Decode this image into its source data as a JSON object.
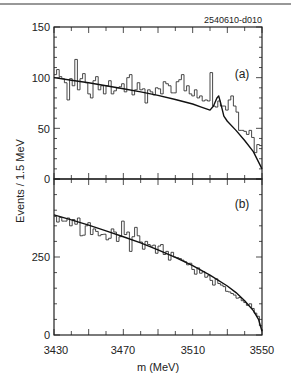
{
  "chart_data": [
    {
      "type": "bar",
      "panel": "(a)",
      "title": "",
      "id_label": "2540610-d010",
      "xlabel": "m (MeV)",
      "ylabel": "Events / 1.5 MeV",
      "xlim": [
        3430,
        3550
      ],
      "ylim": [
        0,
        150
      ],
      "yticks": [
        0,
        50,
        100,
        150
      ],
      "xticks": [
        3430,
        3470,
        3510,
        3550
      ],
      "bin_width": 1.5,
      "histogram": [
        103,
        108,
        101,
        99,
        95,
        78,
        99,
        92,
        118,
        88,
        99,
        104,
        95,
        84,
        80,
        97,
        101,
        88,
        92,
        84,
        92,
        97,
        84,
        87,
        90,
        91,
        94,
        86,
        100,
        103,
        83,
        88,
        95,
        88,
        89,
        75,
        88,
        86,
        83,
        90,
        89,
        84,
        96,
        94,
        92,
        85,
        85,
        96,
        98,
        103,
        87,
        92,
        84,
        82,
        88,
        80,
        82,
        77,
        78,
        77,
        105,
        72,
        71,
        77,
        72,
        72,
        68,
        78,
        82,
        72,
        66,
        48,
        48,
        47,
        44,
        48,
        41,
        26,
        34,
        33
      ],
      "fit": {
        "x": [
          3430,
          3440,
          3450,
          3460,
          3470,
          3480,
          3490,
          3500,
          3510,
          3515,
          3520,
          3522,
          3524,
          3525,
          3526,
          3528,
          3530,
          3535,
          3540,
          3545,
          3550
        ],
        "y": [
          100,
          97.5,
          95,
          92,
          89,
          86,
          82.5,
          78.5,
          74,
          71,
          68,
          72,
          80,
          82,
          76,
          62,
          57,
          48,
          38,
          27,
          10
        ]
      }
    },
    {
      "type": "bar",
      "panel": "(b)",
      "xlabel": "m (MeV)",
      "ylabel": "Events / 1.5 MeV",
      "xlim": [
        3430,
        3550
      ],
      "ylim": [
        0,
        500
      ],
      "yticks": [
        0,
        250
      ],
      "xticks": [
        3430,
        3470,
        3510,
        3550
      ],
      "bin_width": 1.5,
      "histogram": [
        380,
        362,
        377,
        365,
        365,
        375,
        350,
        370,
        355,
        375,
        318,
        320,
        350,
        360,
        322,
        340,
        332,
        318,
        322,
        323,
        305,
        310,
        340,
        330,
        300,
        315,
        365,
        322,
        330,
        268,
        315,
        345,
        318,
        298,
        275,
        300,
        290,
        285,
        288,
        262,
        285,
        290,
        258,
        268,
        240,
        265,
        250,
        248,
        245,
        240,
        235,
        225,
        230,
        210,
        195,
        215,
        198,
        203,
        185,
        190,
        175,
        160,
        180,
        165,
        160,
        155,
        140,
        138,
        133,
        128,
        118,
        120,
        110,
        104,
        95,
        100,
        85,
        70,
        60,
        30
      ],
      "fit": {
        "x": [
          3430,
          3440,
          3450,
          3460,
          3470,
          3480,
          3490,
          3500,
          3510,
          3520,
          3530,
          3535,
          3540,
          3545,
          3548,
          3550
        ],
        "y": [
          385,
          369,
          352,
          334,
          315,
          295,
          273,
          249,
          222,
          192,
          157,
          136,
          110,
          78,
          50,
          12
        ]
      }
    }
  ],
  "labels": {
    "id_label": "2540610-d010",
    "panel_a": "(a)",
    "panel_b": "(b)",
    "ylabel": "Events / 1.5 MeV",
    "xlabel": "m (MeV)",
    "ytick_a": [
      "150",
      "100",
      "50",
      "0"
    ],
    "ytick_b": [
      "250",
      "0"
    ],
    "xticks": [
      "3430",
      "3470",
      "3510",
      "3550"
    ]
  }
}
